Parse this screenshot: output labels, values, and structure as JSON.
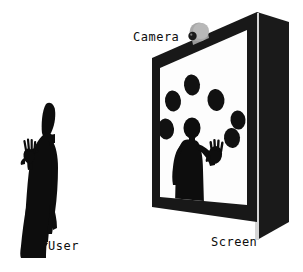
{
  "figure": {
    "background_color": "#ffffff",
    "width": 303,
    "height": 272
  },
  "labels": {
    "camera": "Camera",
    "user": "User",
    "screen": "Screen"
  },
  "colors": {
    "silhouette": "#0d0d0d",
    "frame_dark": "#181818",
    "frame_side": "#1c1c1c",
    "screen_white": "#fdfdfd",
    "camera_body": "#a8a8a8",
    "camera_lens": "#1a1a1a",
    "edge_highlight": "#d8d8d8",
    "background": "#ffffff"
  },
  "scene": {
    "camera": {
      "name": "ceiling-mounted camera",
      "body_cx": 199,
      "body_cy": 33,
      "body_r": 9,
      "lens_cx": 193,
      "lens_cy": 36,
      "lens_r": 4
    },
    "screen_panel": {
      "front_face": "white projection surface",
      "frame": "dark bezel",
      "depth_face": "dark right side panel"
    },
    "targets": {
      "description": "dark elliptical targets projected on screen",
      "count": 6,
      "ellipses": [
        {
          "cx": 192,
          "cy": 85,
          "rx": 8,
          "ry": 10
        },
        {
          "cx": 216,
          "cy": 100,
          "rx": 8,
          "ry": 10
        },
        {
          "cx": 173,
          "cy": 101,
          "rx": 8,
          "ry": 10
        },
        {
          "cx": 166,
          "cy": 128,
          "rx": 8,
          "ry": 10
        },
        {
          "cx": 228,
          "cy": 138,
          "rx": 8,
          "ry": 10
        },
        {
          "cx": 240,
          "cy": 121,
          "rx": 7,
          "ry": 9
        }
      ]
    },
    "shadow_figure": {
      "name": "projected shadow of user on screen",
      "gesture": "right hand raised and touching screen"
    },
    "user_figure": {
      "name": "standing user silhouette",
      "gesture": "left arm raised with fingers extended"
    }
  }
}
